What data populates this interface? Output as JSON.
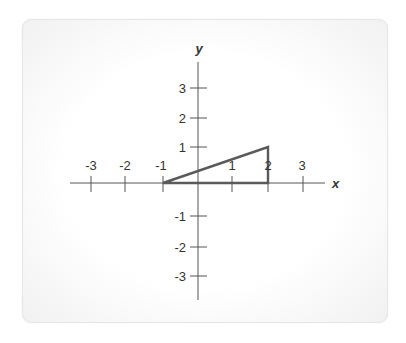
{
  "diagram": {
    "type": "coordinate-plane",
    "axes": {
      "x_label": "x",
      "y_label": "y",
      "x_ticks": [
        {
          "value": -3,
          "label": "-3"
        },
        {
          "value": -2,
          "label": "-2"
        },
        {
          "value": -1,
          "label": "-1"
        },
        {
          "value": 1,
          "label": "1"
        },
        {
          "value": 2,
          "label": "2"
        },
        {
          "value": 3,
          "label": "3"
        }
      ],
      "y_ticks": [
        {
          "value": 3,
          "label": "3"
        },
        {
          "value": 2,
          "label": "2"
        },
        {
          "value": 1,
          "label": "1"
        },
        {
          "value": -1,
          "label": "-1"
        },
        {
          "value": -2,
          "label": "-2"
        },
        {
          "value": -3,
          "label": "-3"
        }
      ]
    },
    "shape": {
      "kind": "right-triangle",
      "vertices": [
        [
          -1,
          0
        ],
        [
          2,
          0
        ],
        [
          2,
          1
        ]
      ],
      "stroke_color": "#5a5a5a"
    },
    "colors": {
      "axis": "#555555",
      "text": "#333333",
      "card_edge": "#f1f1f1"
    }
  }
}
